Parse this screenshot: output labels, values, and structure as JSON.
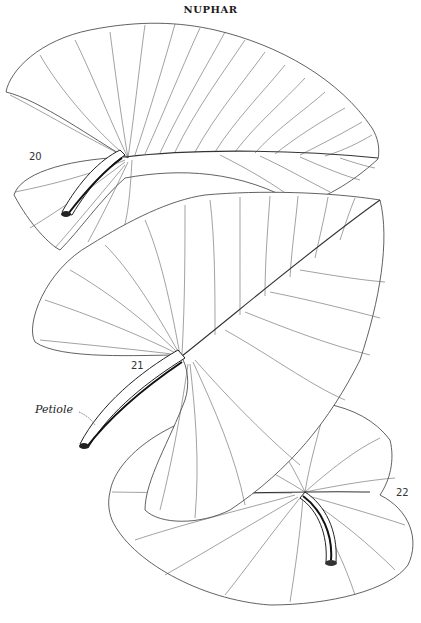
{
  "plate": {
    "title": "NUPHAR"
  },
  "figures": [
    {
      "number": "20",
      "label_position": [
        30,
        158
      ]
    },
    {
      "number": "21",
      "label_position": [
        130,
        366
      ]
    },
    {
      "number": "22",
      "label_position": [
        370,
        490
      ]
    }
  ],
  "annotations": {
    "petiole_label": "Petiole"
  },
  "colors": {
    "ink": "#2a2a2a",
    "paper": "#ffffff"
  }
}
